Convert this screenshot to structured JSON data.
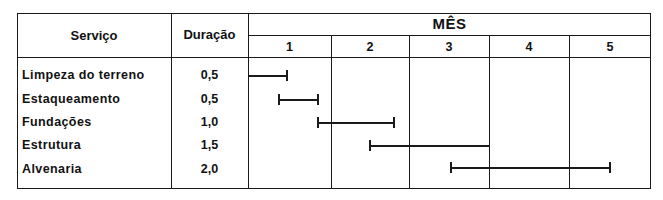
{
  "header": {
    "service_label": "Serviço",
    "duration_label": "Duração",
    "month_group_label": "MÊS",
    "months": [
      "1",
      "2",
      "3",
      "4",
      "5"
    ]
  },
  "rows": [
    {
      "service": "Limpeza do terreno",
      "duration": "0,5"
    },
    {
      "service": "Estaqueamento",
      "duration": "0,5"
    },
    {
      "service": "Fundações",
      "duration": "1,0"
    },
    {
      "service": "Estrutura",
      "duration": "1,5"
    },
    {
      "service": "Alvenaria",
      "duration": "2,0"
    }
  ],
  "chart_data": {
    "type": "gantt",
    "title": "",
    "xlabel": "MÊS",
    "ylabel": "Serviço",
    "categories": [
      "Limpeza do terreno",
      "Estaqueamento",
      "Fundações",
      "Estrutura",
      "Alvenaria"
    ],
    "x_ticks": [
      "1",
      "2",
      "3",
      "4",
      "5"
    ],
    "xlim": [
      0,
      5
    ],
    "durations": [
      0.5,
      0.5,
      1.0,
      1.5,
      2.0
    ],
    "series": [
      {
        "name": "Limpeza do terreno",
        "start": 0.0,
        "end": 0.5,
        "start_cap": false,
        "end_cap": true
      },
      {
        "name": "Estaqueamento",
        "start": 0.37,
        "end": 0.88,
        "start_cap": true,
        "end_cap": true
      },
      {
        "name": "Fundações",
        "start": 0.85,
        "end": 1.83,
        "start_cap": true,
        "end_cap": true
      },
      {
        "name": "Estrutura",
        "start": 1.5,
        "end": 3.0,
        "start_cap": true,
        "end_cap": false
      },
      {
        "name": "Alvenaria",
        "start": 2.5,
        "end": 4.5,
        "start_cap": true,
        "end_cap": true
      }
    ],
    "grid": "month columns",
    "legend": "none"
  }
}
